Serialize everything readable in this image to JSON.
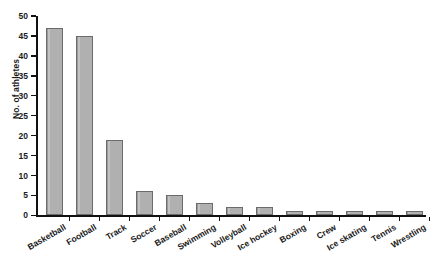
{
  "chart_data": {
    "type": "bar",
    "title": "",
    "xlabel": "",
    "ylabel": "No. of athletes",
    "ylim": [
      0,
      50
    ],
    "ytick_step": 5,
    "yticks": [
      0,
      5,
      10,
      15,
      20,
      25,
      30,
      35,
      40,
      45,
      50
    ],
    "grid": false,
    "legend": null,
    "categories": [
      "Basketball",
      "Football",
      "Track",
      "Soccer",
      "Baseball",
      "Swimming",
      "Volleyball",
      "Ice hockey",
      "Boxing",
      "Crew",
      "Ice skating",
      "Tennis",
      "Wrestling"
    ],
    "values": [
      47,
      45,
      19,
      6,
      5,
      3,
      2,
      2,
      1,
      1,
      1,
      1,
      1
    ],
    "bar_color": "#b0b0b0",
    "bar_edge_color": "#6b6b6b",
    "axis_color": "#111111"
  },
  "caption": {
    "text": ""
  }
}
